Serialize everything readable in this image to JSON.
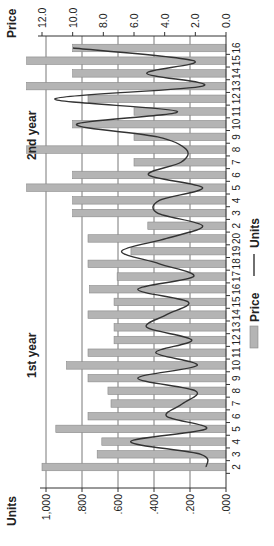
{
  "chart_data": {
    "type": "bar",
    "combo": "bar + smoothed line, dual axis",
    "title": "",
    "orientation_note": "figure rotated 90 degrees counter-clockwise",
    "left_axis": {
      "label": "Units",
      "ticks": [
        ".000",
        ".200",
        ".400",
        ".600",
        ".800",
        "1,000"
      ],
      "range": [
        0,
        1.0
      ]
    },
    "right_axis": {
      "label": "Price",
      "ticks": [
        "0.0",
        "2.0",
        "4.0",
        "6.0",
        "8.0",
        "10.0",
        "12.0"
      ],
      "range": [
        0,
        12.0
      ]
    },
    "groups": [
      {
        "label": "1st year",
        "categories": [
          "2",
          "3",
          "4",
          "5",
          "6",
          "7",
          "8",
          "9",
          "10",
          "11",
          "12",
          "13",
          "14",
          "15",
          "16",
          "17",
          "18",
          "19",
          "20"
        ]
      },
      {
        "label": "2nd year",
        "categories": [
          "2",
          "3",
          "4",
          "5",
          "6",
          "7",
          "8",
          "9",
          "10",
          "11",
          "12",
          "13",
          "14",
          "15",
          "16"
        ]
      }
    ],
    "series": [
      {
        "name": "Price",
        "type": "bar",
        "axis": "right",
        "color": "#b4b4b4",
        "values": [
          12.0,
          8.4,
          8.1,
          11.1,
          9.0,
          7.5,
          7.7,
          9.0,
          10.4,
          9.0,
          7.3,
          7.3,
          9.0,
          7.3,
          8.9,
          7.1,
          9.0,
          6.2,
          9.0,
          5.1,
          10.0,
          10.0,
          13.0,
          10.0,
          6.0,
          13.0,
          6.0,
          10.0,
          6.0,
          9.0,
          13.0,
          10.0,
          13.0,
          10.0
        ]
      },
      {
        "name": "Units",
        "type": "line",
        "axis": "left",
        "color": "#333333",
        "values": [
          0.11,
          0.14,
          0.53,
          0.11,
          0.33,
          0.24,
          0.17,
          0.49,
          0.16,
          0.39,
          0.19,
          0.44,
          0.33,
          0.21,
          0.49,
          0.18,
          0.37,
          0.58,
          0.33,
          0.13,
          0.38,
          0.37,
          0.13,
          0.43,
          0.25,
          0.22,
          0.38,
          0.83,
          0.27,
          0.95,
          0.13,
          0.44,
          0.18,
          0.85
        ]
      }
    ],
    "grid": true,
    "legend": {
      "position": "bottom",
      "entries": [
        "Price",
        "Units"
      ]
    }
  },
  "labels": {
    "left_axis_title": "Units",
    "right_axis_title": "Price",
    "year1": "1st year",
    "year2": "2nd year",
    "legend_bar": "Price",
    "legend_line": "Units"
  }
}
